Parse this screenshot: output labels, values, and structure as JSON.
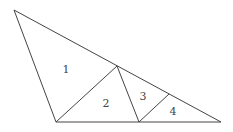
{
  "diagram": {
    "type": "triangle-subdivision",
    "regions": [
      {
        "id": "1",
        "label": "1",
        "x": 66,
        "y": 73
      },
      {
        "id": "2",
        "label": "2",
        "x": 106,
        "y": 107
      },
      {
        "id": "3",
        "label": "3",
        "x": 143,
        "y": 100
      },
      {
        "id": "4",
        "label": "4",
        "x": 173,
        "y": 115
      }
    ],
    "colors": {
      "stroke": "#444444",
      "background": "#ffffff"
    }
  }
}
